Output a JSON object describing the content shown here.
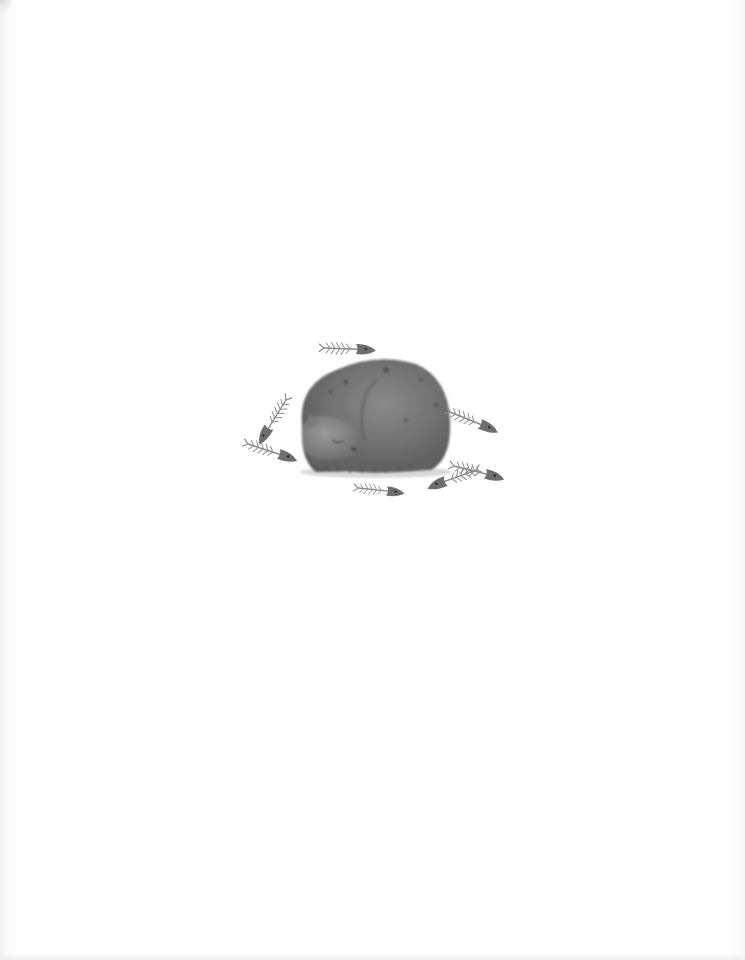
{
  "image": {
    "description": "Watercolor illustration of a gray tabby cat curled up asleep, surrounded by fish skeletons, on a blank white page",
    "background_color": "#ffffff",
    "subject": {
      "name": "sleeping-cat",
      "color": "#6e6e6e",
      "pose": "curled up, head tucked, eyes closed"
    },
    "fish_skeletons": {
      "count": 7,
      "color": "#777777"
    }
  }
}
